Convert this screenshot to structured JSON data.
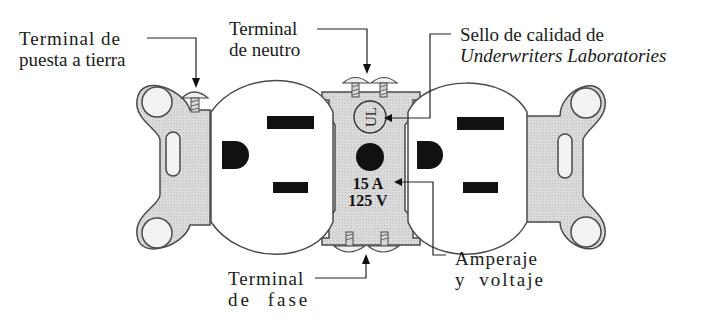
{
  "diagram": {
    "labels": {
      "ground_terminal": {
        "line1": "Terminal de",
        "line2": "puesta a tierra"
      },
      "neutral_terminal": {
        "line1": "Terminal",
        "line2": "de neutro"
      },
      "ul_seal": {
        "line1": "Sello de calidad de",
        "line2": "Underwriters Laboratories"
      },
      "phase_terminal": {
        "line1": "Terminal",
        "line2": "de fase"
      },
      "rating": {
        "line1": "Amperaje",
        "line2": "y voltaje"
      }
    },
    "center_plate": {
      "ul_mark": "UL",
      "amperage": "15 A",
      "voltage": "125 V"
    },
    "colors": {
      "metal_fill": "#d9d9d9",
      "outline": "#4a4a4a",
      "slot": "#111111",
      "face": "#ffffff",
      "text": "#1a1a1a"
    }
  }
}
